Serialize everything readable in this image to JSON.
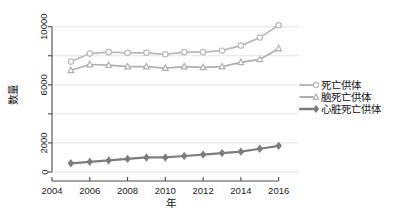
{
  "chart_data": {
    "type": "line",
    "title": "",
    "xlabel": "年",
    "ylabel": "数量",
    "x": [
      2005,
      2006,
      2007,
      2008,
      2009,
      2010,
      2011,
      2012,
      2013,
      2014,
      2015,
      2016
    ],
    "xlim": [
      2004,
      2016.6
    ],
    "ylim": [
      0,
      10600
    ],
    "xticks": [
      2004,
      2006,
      2008,
      2010,
      2012,
      2014,
      2016
    ],
    "xticklabels": [
      "2004",
      "2006",
      "2008",
      "2010",
      "2012",
      "2014",
      "2016"
    ],
    "yticks": [
      0,
      2000,
      4000,
      6000,
      8000,
      10000
    ],
    "yticklabels": [
      "0",
      "2000",
      "",
      "6000",
      "",
      "10000"
    ],
    "grid": true,
    "grid_axis": "y",
    "legend_position": "right",
    "series": [
      {
        "name": "死亡供体",
        "marker": "circle",
        "color": "#b9b9b9",
        "values": [
          7600,
          8150,
          8250,
          8200,
          8200,
          8100,
          8250,
          8250,
          8350,
          8700,
          9250,
          10100
        ]
      },
      {
        "name": "脑死亡供体",
        "marker": "triangle",
        "color": "#b0b0b0",
        "values": [
          7000,
          7400,
          7350,
          7250,
          7250,
          7150,
          7250,
          7200,
          7250,
          7550,
          7750,
          8500
        ]
      },
      {
        "name": "心脏死亡供体",
        "marker": "diamond",
        "color": "#7d7d7d",
        "values": [
          600,
          700,
          800,
          900,
          1000,
          1000,
          1100,
          1200,
          1300,
          1400,
          1600,
          1800
        ]
      }
    ]
  },
  "legend": {
    "items": [
      {
        "label": "死亡供体",
        "marker": "circle-open-icon",
        "color": "#b9b9b9"
      },
      {
        "label": "脑死亡供体",
        "marker": "triangle-open-icon",
        "color": "#b0b0b0"
      },
      {
        "label": "心脏死亡供体",
        "marker": "diamond-filled-icon",
        "color": "#7d7d7d"
      }
    ]
  },
  "axes": {
    "y_title": "数量",
    "x_title": "年"
  }
}
